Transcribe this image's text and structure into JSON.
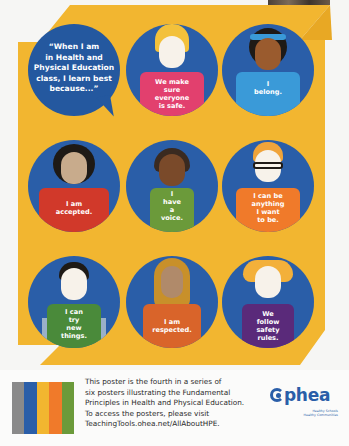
{
  "poster": {
    "colors": {
      "background_yellow": "#f2b630",
      "circle_blue": "#2a5ea8",
      "bubble_blue": "#24589f",
      "footer_bg": "#fbfbfa"
    },
    "intro_bubble": "“When I am in Health and Physical Education class, I learn best because...”",
    "intro_lines": [
      "“When I am",
      "in Health and",
      "Physical Education",
      "class, I learn best",
      "because...”"
    ],
    "figures": [
      {
        "lines": [
          "We make",
          "sure",
          "everyone",
          "is safe."
        ],
        "shirt_color": "#e2406e",
        "hair_color": "#f3c13b",
        "skin": "#f7f2ea"
      },
      {
        "lines": [
          "I",
          "belong."
        ],
        "shirt_color": "#3a9ad8",
        "hair_color": "#1e1a16",
        "skin": "#9a5b2e",
        "headband": "#3a9ad8"
      },
      {
        "lines": [
          "I am",
          "accepted."
        ],
        "shirt_color": "#d1392a",
        "hair_color": "#1e1a16",
        "skin": "#c8ab8c"
      },
      {
        "lines": [
          "I",
          "have",
          "a",
          "voice."
        ],
        "shirt_color": "#6b9a3a",
        "hair_color": "#3a2a20",
        "skin": "#7a4a2a"
      },
      {
        "lines": [
          "I can be",
          "anything",
          "I want",
          "to be."
        ],
        "shirt_color": "#f07a2a",
        "hair_color": "#f0a43a",
        "skin": "#f7f2ea",
        "glasses": true
      },
      {
        "lines": [
          "I can",
          "try",
          "new",
          "things."
        ],
        "shirt_color": "#4a8a3a",
        "hair_color": "#1e1a16",
        "skin": "#f7f2ea",
        "crutches": true
      },
      {
        "lines": [
          "I am",
          "respected."
        ],
        "shirt_color": "#d9642a",
        "hair_color": "#c8902a",
        "skin": "#b08a6a",
        "hijab": true
      },
      {
        "lines": [
          "We",
          "follow",
          "safety",
          "rules."
        ],
        "shirt_color": "#5a2a7a",
        "hair_color": "#f3b03a",
        "skin": "#f7f2ea"
      }
    ]
  },
  "footer": {
    "stripe_colors": [
      "#8a8a8a",
      "#2a5ea8",
      "#f2b630",
      "#f07a2a",
      "#6b9a3a"
    ],
    "text_lines": [
      "This poster is the fourth in a series of",
      "six posters illustrating the Fundamental",
      "Principles in Health and Physical Education.",
      "To access the posters, please visit",
      "TeachingTools.ohea.net/AllAboutHPE."
    ],
    "logo": {
      "word": "phea",
      "tagline_1": "Healthy Schools",
      "tagline_2": "Healthy Communities"
    }
  }
}
